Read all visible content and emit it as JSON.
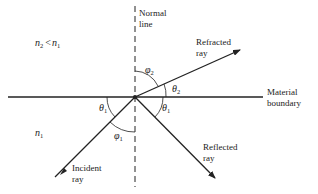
{
  "diagram": {
    "labels": {
      "normal_line_1": "Normal",
      "normal_line_2": "line",
      "refracted_1": "Refracted",
      "refracted_2": "ray",
      "material_1": "Material",
      "material_2": "boundary",
      "reflected_1": "Reflected",
      "reflected_2": "ray",
      "incident_1": "Incident",
      "incident_2": "ray"
    },
    "regions": {
      "upper": {
        "n": "n",
        "sub": "2",
        "rel": "<",
        "n2": "n",
        "sub2": "1"
      },
      "lower": {
        "n": "n",
        "sub": "1"
      }
    },
    "angles": {
      "phi2": {
        "sym": "φ",
        "sub": "2"
      },
      "theta2": {
        "sym": "θ",
        "sub": "2"
      },
      "theta1_left": {
        "sym": "θ",
        "sub": "1"
      },
      "phi1": {
        "sym": "φ",
        "sub": "1"
      },
      "theta1_right": {
        "sym": "θ",
        "sub": "1"
      }
    },
    "colors": {
      "ink": "#222222",
      "background": "#ffffff"
    }
  }
}
